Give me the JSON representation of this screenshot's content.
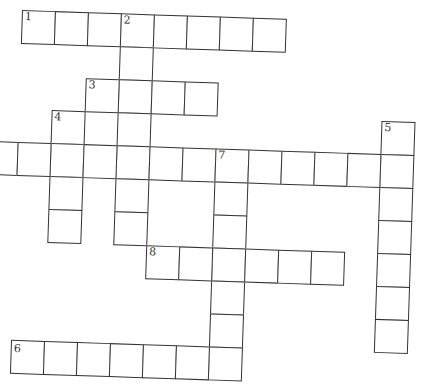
{
  "puzzle": {
    "type": "crossword",
    "cell_size": 33,
    "origin": {
      "x": 22,
      "y": 10
    },
    "colors": {
      "line": "#333333",
      "background": "#ffffff"
    },
    "entries": [
      {
        "number": "1",
        "direction": "across",
        "row": 0,
        "col": 1,
        "length": 8
      },
      {
        "number": "2",
        "direction": "down",
        "row": 0,
        "col": 4,
        "length": 7
      },
      {
        "number": "3",
        "direction": "across",
        "row": 2,
        "col": 3,
        "length": 4
      },
      {
        "number": "4",
        "direction": "down",
        "row": 3,
        "col": 2,
        "length": 4
      },
      {
        "number": "5",
        "direction": "down",
        "row": 3,
        "col": 12,
        "length": 7
      },
      {
        "number": "6",
        "direction": "across",
        "row": 4,
        "col": 0,
        "length": 12
      },
      {
        "number": "7",
        "direction": "down",
        "row": 4,
        "col": 7,
        "length": 7
      },
      {
        "number": "8",
        "direction": "across",
        "row": 7,
        "col": 5,
        "length": 6
      },
      {
        "number": "9",
        "direction": "across",
        "row": 10,
        "col": 1,
        "length": 7
      }
    ],
    "labels": {
      "n1": "1",
      "n2": "2",
      "n3": "3",
      "n4": "4",
      "n5": "5",
      "n6": "6",
      "n7": "7",
      "n8": "8",
      "n9": "9"
    }
  }
}
